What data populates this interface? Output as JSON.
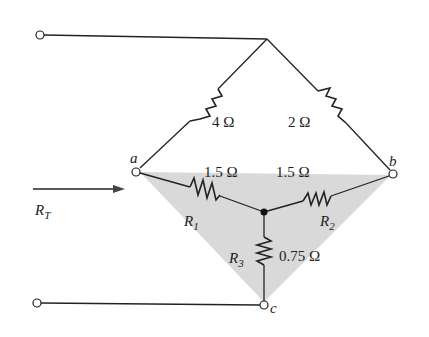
{
  "diagram": {
    "type": "circuit",
    "colors": {
      "wire": "#222222",
      "shade": "#d9d9d9",
      "background": "#ffffff"
    },
    "nodes": {
      "a": "a",
      "b": "b",
      "c": "c"
    },
    "upper_resistors": {
      "left": "4 Ω",
      "right": "2 Ω"
    },
    "y_resistors": {
      "r1": {
        "name": "R",
        "sub": "1",
        "value": "1.5 Ω"
      },
      "r2": {
        "name": "R",
        "sub": "2",
        "value": "1.5 Ω"
      },
      "r3": {
        "name": "R",
        "sub": "3",
        "value": "0.75 Ω"
      }
    },
    "input": {
      "name": "R",
      "sub": "T"
    }
  }
}
